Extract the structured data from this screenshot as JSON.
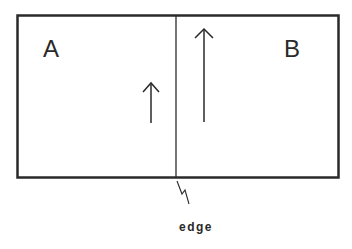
{
  "diagram": {
    "regions": [
      {
        "id": "A",
        "label": "A"
      },
      {
        "id": "B",
        "label": "B"
      }
    ],
    "edge_label": "edge",
    "arrows": [
      {
        "region": "A",
        "direction": "up",
        "relative_length": "short"
      },
      {
        "region": "B",
        "direction": "up",
        "relative_length": "long"
      }
    ],
    "colors": {
      "stroke": "#2a2a2a",
      "background": "#ffffff"
    }
  }
}
